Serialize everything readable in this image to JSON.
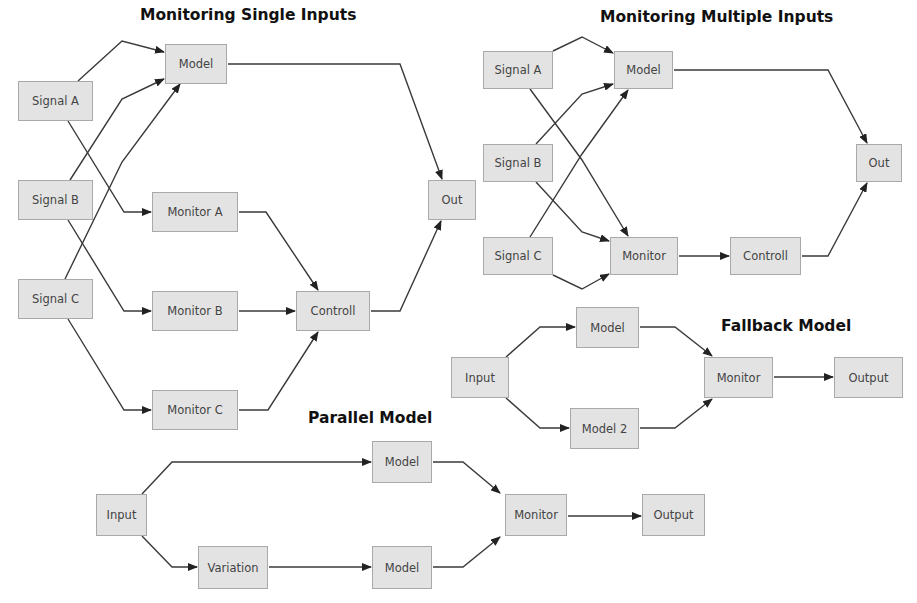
{
  "diagrams": {
    "single_inputs": {
      "title": "Monitoring Single Inputs",
      "nodes": {
        "model": "Model",
        "signal_a": "Signal A",
        "signal_b": "Signal B",
        "signal_c": "Signal C",
        "monitor_a": "Monitor A",
        "monitor_b": "Monitor B",
        "monitor_c": "Monitor C",
        "controll": "Controll",
        "out": "Out"
      }
    },
    "multiple_inputs": {
      "title": "Monitoring Multiple Inputs",
      "nodes": {
        "signal_a": "Signal A",
        "signal_b": "Signal B",
        "signal_c": "Signal C",
        "model": "Model",
        "monitor": "Monitor",
        "controll": "Controll",
        "out": "Out"
      }
    },
    "fallback": {
      "title": "Fallback Model",
      "nodes": {
        "input": "Input",
        "model": "Model",
        "model_2": "Model 2",
        "monitor": "Monitor",
        "output": "Output"
      }
    },
    "parallel": {
      "title": "Parallel Model",
      "nodes": {
        "input": "Input",
        "model_top": "Model",
        "variation": "Variation",
        "model_bottom": "Model",
        "monitor": "Monitor",
        "output": "Output"
      }
    }
  },
  "colors": {
    "node_fill": "#e3e3e3",
    "node_border": "#a9a9a9",
    "edge": "#333333",
    "title": "#111111"
  }
}
